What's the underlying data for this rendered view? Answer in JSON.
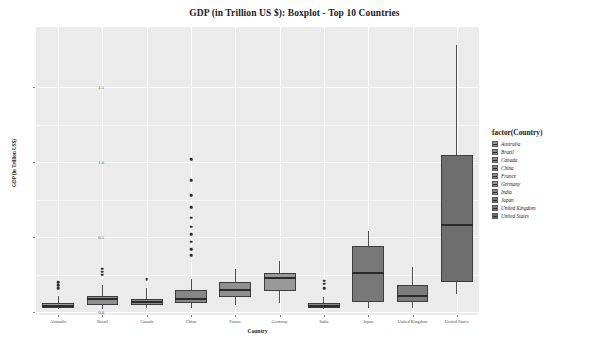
{
  "chart_data": {
    "type": "box",
    "title": "GDP (in Trillion US $): Boxplot - Top 10 Countries",
    "xlabel": "Country",
    "ylabel": "GDP (in Trillion US$)",
    "ylim": [
      -0.02,
      1.9
    ],
    "yticks": [
      0.0,
      0.5,
      1.0,
      1.5
    ],
    "ytick_labels": [
      "0.0",
      "0.5",
      "1.0",
      "1.5"
    ],
    "grid": true,
    "legend_title": "factor(Country)",
    "legend_position": "right",
    "categories": [
      "Australia",
      "Brazil",
      "Canada",
      "China",
      "France",
      "Germany",
      "India",
      "Japan",
      "United Kingdom",
      "United States"
    ],
    "boxes": [
      {
        "name": "Australia",
        "min": 0.02,
        "q1": 0.03,
        "median": 0.04,
        "q3": 0.06,
        "max": 0.11,
        "outliers": [
          0.16,
          0.18,
          0.2
        ]
      },
      {
        "name": "Brazil",
        "min": 0.02,
        "q1": 0.05,
        "median": 0.09,
        "q3": 0.11,
        "max": 0.18,
        "outliers": [
          0.25,
          0.27,
          0.29
        ]
      },
      {
        "name": "Canada",
        "min": 0.03,
        "q1": 0.05,
        "median": 0.07,
        "q3": 0.09,
        "max": 0.16,
        "outliers": [
          0.22
        ]
      },
      {
        "name": "China",
        "min": 0.03,
        "q1": 0.06,
        "median": 0.09,
        "q3": 0.15,
        "max": 0.22,
        "outliers": [
          0.38,
          0.42,
          0.47,
          0.52,
          0.57,
          0.63,
          0.7,
          0.78,
          0.88,
          1.02
        ]
      },
      {
        "name": "France",
        "min": 0.05,
        "q1": 0.1,
        "median": 0.15,
        "q3": 0.2,
        "max": 0.29,
        "outliers": []
      },
      {
        "name": "Germany",
        "min": 0.06,
        "q1": 0.14,
        "median": 0.23,
        "q3": 0.26,
        "max": 0.34,
        "outliers": []
      },
      {
        "name": "India",
        "min": 0.02,
        "q1": 0.03,
        "median": 0.04,
        "q3": 0.06,
        "max": 0.1,
        "outliers": [
          0.16,
          0.19,
          0.21
        ]
      },
      {
        "name": "Japan",
        "min": 0.03,
        "q1": 0.07,
        "median": 0.26,
        "q3": 0.44,
        "max": 0.54,
        "outliers": []
      },
      {
        "name": "United Kingdom",
        "min": 0.03,
        "q1": 0.07,
        "median": 0.11,
        "q3": 0.18,
        "max": 0.3,
        "outliers": []
      },
      {
        "name": "United States",
        "min": 0.12,
        "q1": 0.2,
        "median": 0.58,
        "q3": 1.05,
        "max": 1.78,
        "outliers": []
      }
    ],
    "series_colors": [
      "#9a9a9a",
      "#8e8e8e",
      "#8a8a8a",
      "#868686",
      "#8f8f8f",
      "#999999",
      "#8c8c8c",
      "#787878",
      "#7c7c7c",
      "#6e6e6e"
    ]
  },
  "legend": {
    "title": "factor(Country)",
    "items": [
      {
        "label": "Australia"
      },
      {
        "label": "Brazil"
      },
      {
        "label": "Canada"
      },
      {
        "label": "China"
      },
      {
        "label": "France"
      },
      {
        "label": "Germany"
      },
      {
        "label": "India"
      },
      {
        "label": "Japan"
      },
      {
        "label": "United Kingdom"
      },
      {
        "label": "United States"
      }
    ]
  }
}
